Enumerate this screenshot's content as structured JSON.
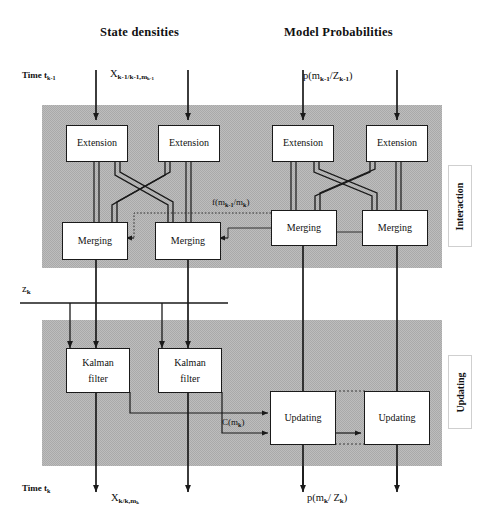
{
  "diagram": {
    "columns": [
      {
        "name": "state-densities",
        "header": "State densities"
      },
      {
        "name": "model-probabilities",
        "header": "Model  Probabilities"
      }
    ],
    "time_labels": {
      "top": {
        "prefix": "Time t",
        "sub": "k-1"
      },
      "bottom": {
        "prefix": "Time t",
        "sub": "k"
      }
    },
    "signal_labels": {
      "state_in": {
        "base": "X",
        "sub": "k-1/k-1,m",
        "subsub": "k-1"
      },
      "state_in_text": "X k-1/k-1,m k-1",
      "prob_in_text": "p(m k-1 / Z k-1 )",
      "measurement": {
        "base": "z",
        "sub": "k"
      },
      "mixing_prob": "f(m k-1 /m k )",
      "likelihood": "C(m k )",
      "state_out_text": "X k/k,m k",
      "prob_out_text": "p(m k / Z k )"
    },
    "bands": [
      {
        "name": "interaction",
        "label": "Interaction",
        "fill": "#b8b8b8"
      },
      {
        "name": "updating",
        "label": "Updating",
        "fill": "#b8b8b8"
      }
    ],
    "blocks": {
      "extension": "Extension",
      "merging": "Merging",
      "kalman_line1": "Kalman",
      "kalman_line2": "filter",
      "updating": "Updating"
    },
    "colors": {
      "band_fill": "#b8b8b8",
      "line": "#1a1a1a",
      "box_fill": "#ffffff",
      "page_bg": "#ffffff",
      "dotted": "#3a3a3a"
    }
  }
}
